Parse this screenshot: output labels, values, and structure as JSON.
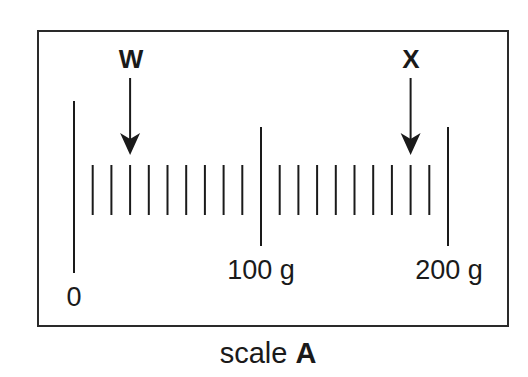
{
  "title": "scale A",
  "caption": {
    "prefix": "scale",
    "letter": "A"
  },
  "scale": {
    "unit": "g",
    "min": 0,
    "max": 200,
    "major_labels": [
      {
        "value": 0,
        "label": "0"
      },
      {
        "value": 100,
        "label": "100 g"
      },
      {
        "value": 200,
        "label": "200 g"
      }
    ],
    "minor_tick_interval": 10,
    "minor_ticks_per_major": 9
  },
  "markers": [
    {
      "label": "W",
      "value": 30
    },
    {
      "label": "X",
      "value": 180
    }
  ],
  "colors": {
    "ink": "#1a1a1a",
    "background": "#ffffff",
    "frame": "#2a2a2a"
  }
}
